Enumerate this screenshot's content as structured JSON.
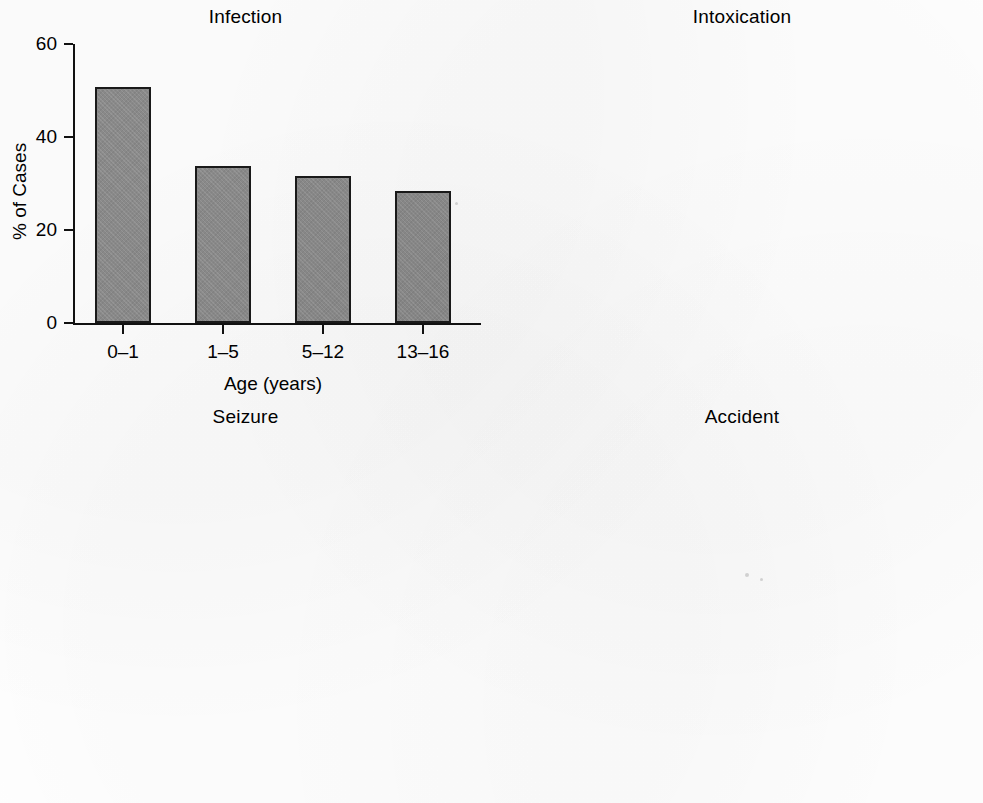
{
  "figure": {
    "panel_count": 4,
    "bar_color": "#8c8c8c",
    "bar_edge_color": "#1a1a1a",
    "background": "#ffffff"
  },
  "panels": [
    {
      "title": "Infection",
      "ylabel": "% of Cases",
      "xlabel": "Age (years)",
      "yticks": [
        "0",
        "20",
        "40",
        "60"
      ],
      "xticks": [
        "0–1",
        "1–5",
        "5–12",
        "13–16"
      ]
    },
    {
      "title": "Intoxication",
      "ylabel": "% of Cases",
      "xlabel": "Age (years)",
      "yticks": [
        "0",
        "10",
        "20",
        "30",
        "40"
      ],
      "xticks": [
        "0–1",
        "1–5",
        "5–12",
        "13–16"
      ]
    },
    {
      "title": "Seizure",
      "ylabel": "% of Cases",
      "xlabel": "Age (years)",
      "yticks": [
        "0",
        "5",
        "10",
        "15",
        "20"
      ],
      "xticks": [
        "0–1",
        "1–5",
        "5–12",
        "13–16"
      ]
    },
    {
      "title": "Accident",
      "ylabel": "% of Cases",
      "xlabel": "Age (years)",
      "yticks": [
        "0",
        "5",
        "10",
        "15"
      ],
      "xticks": [
        "0–1",
        "1–5",
        "5–12",
        "13–16"
      ]
    }
  ],
  "chart_data": [
    {
      "type": "bar",
      "title": "Infection",
      "xlabel": "Age (years)",
      "ylabel": "% of Cases",
      "categories": [
        "0–1",
        "1–5",
        "5–12",
        "13–16"
      ],
      "values": [
        50.8,
        33.8,
        31.6,
        28.3
      ],
      "ylim": [
        0,
        60
      ],
      "ytick_values": [
        0,
        20,
        40,
        60
      ],
      "grid": false,
      "legend": null
    },
    {
      "type": "bar",
      "title": "Intoxication",
      "xlabel": "Age (years)",
      "ylabel": "% of Cases",
      "categories": [
        "0–1",
        "1–5",
        "5–12",
        "13–16"
      ],
      "values": [
        0,
        10.1,
        7.4,
        34.7
      ],
      "ylim": [
        0,
        40
      ],
      "ytick_values": [
        0,
        10,
        20,
        30,
        40
      ],
      "grid": false,
      "legend": null
    },
    {
      "type": "bar",
      "title": "Seizure",
      "xlabel": "Age (years)",
      "ylabel": "% of Cases",
      "categories": [
        "0–1",
        "1–5",
        "5–12",
        "13–16"
      ],
      "values": [
        4.3,
        13.5,
        16.7,
        4.3
      ],
      "ylim": [
        0,
        20
      ],
      "ytick_values": [
        0,
        5,
        10,
        15,
        20
      ],
      "grid": false,
      "legend": null
    },
    {
      "type": "bar",
      "title": "Accident",
      "xlabel": "Age (years)",
      "ylabel": "% of Cases",
      "categories": [
        "0–1",
        "1–5",
        "5–12",
        "13–16"
      ],
      "values": [
        3.2,
        11.2,
        5.6,
        6.5
      ],
      "ylim": [
        0,
        15
      ],
      "ytick_values": [
        0,
        5,
        10,
        15
      ],
      "grid": false,
      "legend": null
    }
  ]
}
